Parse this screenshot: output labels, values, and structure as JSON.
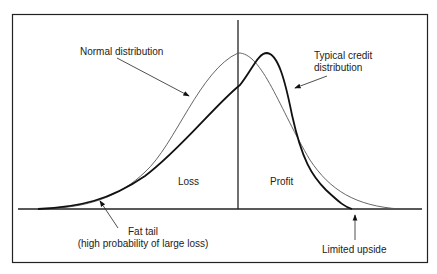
{
  "diagram": {
    "labels": {
      "normal": "Normal distribution",
      "credit_line1": "Typical credit",
      "credit_line2": "distribution",
      "loss": "Loss",
      "profit": "Profit",
      "fat_tail_line1": "Fat tail",
      "fat_tail_line2": "(high probability of large loss)",
      "limited_upside": "Limited upside"
    },
    "colors": {
      "frame": "#222222",
      "normal_curve": "#555555",
      "credit_curve": "#111111"
    }
  }
}
